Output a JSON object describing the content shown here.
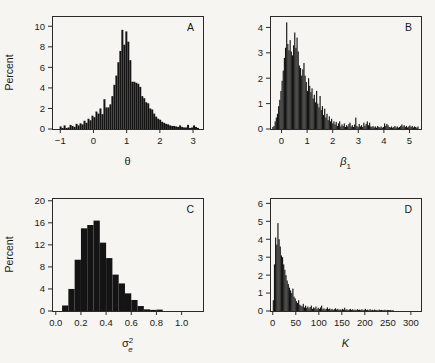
{
  "figure": {
    "background": "#f6f5f2",
    "ink": "#141414",
    "shared_ylabel": "Percent"
  },
  "chart_data": [
    {
      "type": "bar",
      "panel": "A",
      "title": "",
      "xlabel": "θ",
      "ylabel": "Percent",
      "xlim": [
        -1.25,
        3.3
      ],
      "ylim": [
        0,
        11
      ],
      "xticks": [
        -1,
        0,
        1,
        2,
        3
      ],
      "xticklabels": [
        "−1",
        "0",
        "1",
        "2",
        "3"
      ],
      "yticks": [
        0,
        2,
        4,
        6,
        8,
        10
      ],
      "yticklabels": [
        "0",
        "2",
        "4",
        "6",
        "8",
        "10"
      ],
      "grid": false,
      "legend": "none",
      "bin_width": 0.06,
      "bin_starts": [
        -1.02,
        -0.96,
        -0.9,
        -0.84,
        -0.78,
        -0.72,
        -0.66,
        -0.6,
        -0.54,
        -0.48,
        -0.42,
        -0.36,
        -0.3,
        -0.24,
        -0.18,
        -0.12,
        -0.06,
        0.0,
        0.06,
        0.12,
        0.18,
        0.24,
        0.3,
        0.36,
        0.42,
        0.48,
        0.54,
        0.6,
        0.66,
        0.72,
        0.78,
        0.84,
        0.9,
        0.96,
        1.02,
        1.08,
        1.14,
        1.2,
        1.26,
        1.32,
        1.38,
        1.44,
        1.5,
        1.56,
        1.62,
        1.68,
        1.74,
        1.8,
        1.86,
        1.92,
        1.98,
        2.04,
        2.1,
        2.16,
        2.22,
        2.28,
        2.34,
        2.4,
        2.46,
        2.52,
        2.58,
        2.64,
        2.7,
        2.76,
        2.82,
        2.88,
        2.94,
        3.0,
        3.06,
        3.12
      ],
      "values": [
        0.25,
        0.1,
        0.35,
        0.1,
        0.15,
        0.4,
        0.3,
        0.2,
        0.5,
        0.35,
        0.55,
        0.45,
        0.8,
        0.6,
        1.0,
        0.85,
        1.3,
        1.15,
        1.7,
        1.5,
        2.0,
        1.45,
        2.9,
        2.1,
        2.1,
        2.4,
        3.2,
        4.3,
        5.2,
        6.5,
        7.6,
        9.65,
        8.2,
        9.5,
        8.5,
        6.7,
        4.6,
        4.6,
        4.5,
        4.4,
        4.1,
        3.2,
        3.0,
        2.6,
        2.5,
        2.0,
        1.9,
        1.5,
        1.2,
        1.0,
        0.9,
        0.7,
        0.6,
        0.5,
        0.45,
        0.35,
        0.3,
        0.3,
        0.25,
        0.2,
        0.35,
        0.2,
        0.15,
        0.15,
        0.4,
        0.1,
        0.15,
        0.35,
        0.2,
        0.1
      ]
    },
    {
      "type": "bar",
      "panel": "B",
      "title": "",
      "xlabel": "β₁",
      "ylabel": "Percent",
      "xlim": [
        -0.45,
        5.45
      ],
      "ylim": [
        0,
        4.45
      ],
      "xticks": [
        0,
        1,
        2,
        3,
        4,
        5
      ],
      "xticklabels": [
        "0",
        "1",
        "2",
        "3",
        "4",
        "5"
      ],
      "yticks": [
        0,
        1,
        2,
        3,
        4
      ],
      "yticklabels": [
        "0",
        "1",
        "2",
        "3",
        "4"
      ],
      "grid": false,
      "legend": "none",
      "bin_width": 0.045,
      "bin_starts": [
        -0.36,
        -0.315,
        -0.27,
        -0.225,
        -0.18,
        -0.135,
        -0.09,
        -0.045,
        0.0,
        0.045,
        0.09,
        0.135,
        0.18,
        0.225,
        0.27,
        0.315,
        0.36,
        0.405,
        0.45,
        0.495,
        0.54,
        0.585,
        0.63,
        0.675,
        0.72,
        0.765,
        0.81,
        0.855,
        0.9,
        0.945,
        0.99,
        1.035,
        1.08,
        1.125,
        1.17,
        1.215,
        1.26,
        1.305,
        1.35,
        1.395,
        1.44,
        1.485,
        1.53,
        1.575,
        1.62,
        1.665,
        1.71,
        1.755,
        1.8,
        1.845,
        1.89,
        1.935,
        1.98,
        2.025,
        2.07,
        2.115,
        2.16,
        2.205,
        2.25,
        2.295,
        2.34,
        2.385,
        2.43,
        2.475,
        2.52,
        2.565,
        2.61,
        2.655,
        2.7,
        2.745,
        2.79,
        2.835,
        2.88,
        2.925,
        2.97,
        3.015,
        3.06,
        3.105,
        3.15,
        3.195,
        3.24,
        3.285,
        3.33,
        3.375,
        3.42,
        3.465,
        3.51,
        3.555,
        3.6,
        3.645,
        3.69,
        3.735,
        3.78,
        3.825,
        3.87,
        3.915,
        3.96,
        4.005,
        4.05,
        4.095,
        4.14,
        4.185,
        4.23,
        4.275,
        4.32,
        4.365,
        4.41,
        4.455,
        4.5,
        4.545,
        4.59,
        4.635,
        4.68,
        4.725,
        4.77,
        4.815,
        4.86,
        4.905,
        4.95,
        4.995,
        5.04,
        5.085,
        5.13,
        5.175,
        5.22,
        5.265,
        5.31
      ],
      "values": [
        0.08,
        0.12,
        0.3,
        0.45,
        0.6,
        0.9,
        1.15,
        1.5,
        1.9,
        2.3,
        2.8,
        3.2,
        4.2,
        3.35,
        3.1,
        3.5,
        3.05,
        2.9,
        3.3,
        3.8,
        3.2,
        3.6,
        3.05,
        2.5,
        2.4,
        2.1,
        2.35,
        2.6,
        2.1,
        1.85,
        1.5,
        2.0,
        1.7,
        1.45,
        1.6,
        1.2,
        1.35,
        1.05,
        1.5,
        1.0,
        0.85,
        1.3,
        0.75,
        0.9,
        0.55,
        0.8,
        0.45,
        0.6,
        0.35,
        0.5,
        0.3,
        0.4,
        0.22,
        0.3,
        0.18,
        0.28,
        0.12,
        0.22,
        0.3,
        0.1,
        0.18,
        0.12,
        0.22,
        0.08,
        0.15,
        0.1,
        0.2,
        0.25,
        0.1,
        0.15,
        0.08,
        0.18,
        0.45,
        0.12,
        0.08,
        0.2,
        0.1,
        0.15,
        0.08,
        0.25,
        0.12,
        0.2,
        0.3,
        0.15,
        0.25,
        0.1,
        0.08,
        0.12,
        0.06,
        0.1,
        0.05,
        0.12,
        0.08,
        0.06,
        0.1,
        0.05,
        0.08,
        0.22,
        0.12,
        0.2,
        0.15,
        0.08,
        0.06,
        0.1,
        0.05,
        0.08,
        0.12,
        0.06,
        0.1,
        0.05,
        0.08,
        0.12,
        0.18,
        0.1,
        0.15,
        0.08,
        0.12,
        0.06,
        0.1,
        0.14,
        0.08,
        0.12,
        0.06,
        0.1,
        0.08,
        0.05,
        0.1
      ]
    },
    {
      "type": "bar",
      "panel": "C",
      "title": "",
      "xlabel": "σ²ₑ",
      "xlabel_parts": {
        "base": "σ",
        "sup": "2",
        "sub": "e"
      },
      "ylabel": "Percent",
      "xlim": [
        -0.03,
        1.17
      ],
      "ylim": [
        0,
        20.5
      ],
      "xticks": [
        0.0,
        0.2,
        0.4,
        0.6,
        0.8,
        1.0
      ],
      "xticklabels": [
        "0.0",
        "0.2",
        "0.4",
        "0.6",
        "0.8",
        "1.0"
      ],
      "yticks": [
        0,
        4,
        8,
        12,
        16,
        20
      ],
      "yticklabels": [
        "0",
        "4",
        "8",
        "12",
        "16",
        "20"
      ],
      "grid": false,
      "legend": "none",
      "bin_width": 0.05,
      "bin_starts": [
        0.05,
        0.1,
        0.15,
        0.2,
        0.25,
        0.3,
        0.35,
        0.4,
        0.45,
        0.5,
        0.55,
        0.6,
        0.65,
        0.7,
        0.75,
        0.8,
        0.85,
        0.9,
        0.95,
        1.0,
        1.05,
        1.1
      ],
      "values": [
        1.0,
        4.0,
        9.3,
        15.0,
        15.6,
        16.4,
        12.4,
        9.6,
        6.6,
        5.0,
        3.2,
        2.0,
        0.9,
        0.3,
        0.2,
        0.25,
        0.0,
        0.0,
        0.0,
        0.0,
        0.0,
        0.0
      ]
    },
    {
      "type": "bar",
      "panel": "D",
      "title": "",
      "xlabel": "K",
      "ylabel": "Percent",
      "xlim": [
        -6,
        322
      ],
      "ylim": [
        0,
        6.3
      ],
      "xticks": [
        0,
        50,
        100,
        150,
        200,
        250,
        300
      ],
      "xticklabels": [
        "0",
        "50",
        "100",
        "150",
        "200",
        "250",
        "300"
      ],
      "yticks": [
        0,
        1,
        2,
        3,
        4,
        5,
        6
      ],
      "yticklabels": [
        "0",
        "1",
        "2",
        "3",
        "4",
        "5",
        "6"
      ],
      "grid": false,
      "legend": "none",
      "bin_width": 2.5,
      "bin_starts": [
        0,
        2.5,
        5,
        7.5,
        10,
        12.5,
        15,
        17.5,
        20,
        22.5,
        25,
        27.5,
        30,
        32.5,
        35,
        37.5,
        40,
        42.5,
        45,
        47.5,
        50,
        52.5,
        55,
        57.5,
        60,
        62.5,
        65,
        67.5,
        70,
        72.5,
        75,
        77.5,
        80,
        82.5,
        85,
        87.5,
        90,
        92.5,
        95,
        97.5,
        100,
        102.5,
        105,
        107.5,
        110,
        112.5,
        115,
        117.5,
        120,
        122.5,
        125,
        127.5,
        130,
        132.5,
        135,
        137.5,
        140,
        142.5,
        145,
        147.5,
        150,
        152.5,
        155,
        157.5,
        160,
        162.5,
        165,
        167.5,
        170,
        172.5,
        175,
        177.5,
        180,
        182.5,
        185,
        187.5,
        190,
        192.5,
        195,
        197.5,
        200,
        202.5,
        205,
        207.5,
        210,
        212.5,
        215,
        217.5,
        220,
        222.5,
        225,
        227.5,
        230,
        232.5,
        235,
        237.5,
        240,
        242.5,
        245,
        247.5,
        250,
        252.5,
        255,
        257.5,
        260
      ],
      "values": [
        0.6,
        2.6,
        4.1,
        3.7,
        4.9,
        4.0,
        3.6,
        3.1,
        3.0,
        2.6,
        2.3,
        2.0,
        1.7,
        1.5,
        1.3,
        1.15,
        1.0,
        1.25,
        0.8,
        0.7,
        0.55,
        0.45,
        0.6,
        0.35,
        0.3,
        0.25,
        0.4,
        0.2,
        0.3,
        0.18,
        0.25,
        0.15,
        0.22,
        0.3,
        0.12,
        0.2,
        0.15,
        0.25,
        0.1,
        0.18,
        0.12,
        0.2,
        0.3,
        0.1,
        0.15,
        0.08,
        0.12,
        0.2,
        0.1,
        0.14,
        0.08,
        0.12,
        0.06,
        0.1,
        0.15,
        0.08,
        0.12,
        0.06,
        0.1,
        0.05,
        0.12,
        0.08,
        0.18,
        0.06,
        0.1,
        0.05,
        0.08,
        0.12,
        0.06,
        0.1,
        0.05,
        0.08,
        0.04,
        0.1,
        0.06,
        0.08,
        0.05,
        0.1,
        0.04,
        0.07,
        0.12,
        0.05,
        0.08,
        0.04,
        0.1,
        0.05,
        0.07,
        0.04,
        0.08,
        0.05,
        0.06,
        0.04,
        0.08,
        0.05,
        0.06,
        0.04,
        0.05,
        0.07,
        0.04,
        0.06,
        0.05,
        0.04,
        0.06,
        0.03,
        0.05
      ]
    }
  ]
}
